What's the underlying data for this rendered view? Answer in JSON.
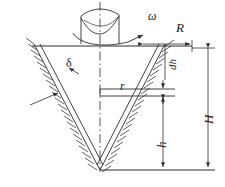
{
  "figure": {
    "stroke_color": "#2b2b2b",
    "background_color": "#ffffff",
    "labels": {
      "omega": "ω",
      "R": "R",
      "delta": "δ",
      "r": "r",
      "dh": "dh",
      "h": "h",
      "H": "H"
    },
    "parts": {
      "cylinder": "rotating-cylinder",
      "free_surface": "concave-free-surface",
      "cone_left_wall": "cone-left-wall",
      "cone_right_wall": "cone-right-wall",
      "centerline": "axis-centerline",
      "hatching": "ground-hatching",
      "dim_R": "radius-dimension",
      "dim_dh": "element-thickness-dimension",
      "dim_h": "height-h-dimension",
      "dim_H": "height-H-dimension"
    }
  }
}
